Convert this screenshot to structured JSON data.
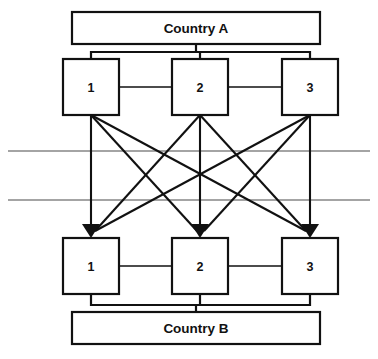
{
  "diagram": {
    "title_top": "Country A",
    "title_bottom": "Country B",
    "top_country_box": {
      "x": 72,
      "y": 12,
      "w": 248,
      "h": 32
    },
    "bottom_country_box": {
      "x": 72,
      "y": 312,
      "w": 248,
      "h": 32
    },
    "top_nodes": [
      {
        "label": "1",
        "x": 63,
        "y": 59,
        "w": 56,
        "h": 56,
        "cx": 91,
        "cy": 87
      },
      {
        "label": "2",
        "x": 172,
        "y": 59,
        "w": 56,
        "h": 56,
        "cx": 200,
        "cy": 87
      },
      {
        "label": "3",
        "x": 282,
        "y": 59,
        "w": 56,
        "h": 56,
        "cx": 310,
        "cy": 87
      }
    ],
    "bottom_nodes": [
      {
        "label": "1",
        "x": 63,
        "y": 238,
        "w": 56,
        "h": 56,
        "cx": 91,
        "cy": 266
      },
      {
        "label": "2",
        "x": 172,
        "y": 238,
        "w": 56,
        "h": 56,
        "cx": 200,
        "cy": 266
      },
      {
        "label": "3",
        "x": 282,
        "y": 238,
        "w": 56,
        "h": 56,
        "cx": 310,
        "cy": 266
      }
    ],
    "border_rules": [
      {
        "name": "border-line-upper",
        "x1": 8,
        "y1": 151,
        "x2": 370,
        "y2": 151
      },
      {
        "name": "border-line-lower",
        "x1": 8,
        "y1": 200,
        "x2": 370,
        "y2": 200
      }
    ],
    "top_bracket": {
      "y": 52,
      "x_left": 91,
      "x_right": 310,
      "country_y": 44
    },
    "bottom_bracket": {
      "y": 305,
      "x_left": 91,
      "x_right": 310,
      "country_y": 312
    },
    "peer_links_top": [
      {
        "from": "1",
        "to": "2",
        "x1": 119,
        "x2": 172,
        "y": 87
      },
      {
        "from": "2",
        "to": "3",
        "x1": 228,
        "x2": 282,
        "y": 87
      }
    ],
    "peer_links_bottom": [
      {
        "from": "1",
        "to": "2",
        "x1": 119,
        "x2": 172,
        "y": 266
      },
      {
        "from": "2",
        "to": "3",
        "x1": 228,
        "x2": 282,
        "y": 266
      }
    ],
    "cross_links": [
      {
        "from": "A1",
        "to": "B1",
        "x1": 91,
        "y1": 115,
        "x2": 91,
        "y2": 238
      },
      {
        "from": "A1",
        "to": "B2",
        "x1": 91,
        "y1": 115,
        "x2": 200,
        "y2": 238
      },
      {
        "from": "A1",
        "to": "B3",
        "x1": 91,
        "y1": 115,
        "x2": 310,
        "y2": 238
      },
      {
        "from": "A2",
        "to": "B1",
        "x1": 200,
        "y1": 115,
        "x2": 91,
        "y2": 238
      },
      {
        "from": "A2",
        "to": "B2",
        "x1": 200,
        "y1": 115,
        "x2": 200,
        "y2": 238
      },
      {
        "from": "A2",
        "to": "B3",
        "x1": 200,
        "y1": 115,
        "x2": 310,
        "y2": 238
      },
      {
        "from": "A3",
        "to": "B1",
        "x1": 310,
        "y1": 115,
        "x2": 91,
        "y2": 238
      },
      {
        "from": "A3",
        "to": "B2",
        "x1": 310,
        "y1": 115,
        "x2": 200,
        "y2": 238
      },
      {
        "from": "A3",
        "to": "B3",
        "x1": 310,
        "y1": 115,
        "x2": 310,
        "y2": 238
      }
    ],
    "colors": {
      "line": "#111111",
      "rule": "#4a4a4a",
      "background": "#ffffff"
    }
  }
}
